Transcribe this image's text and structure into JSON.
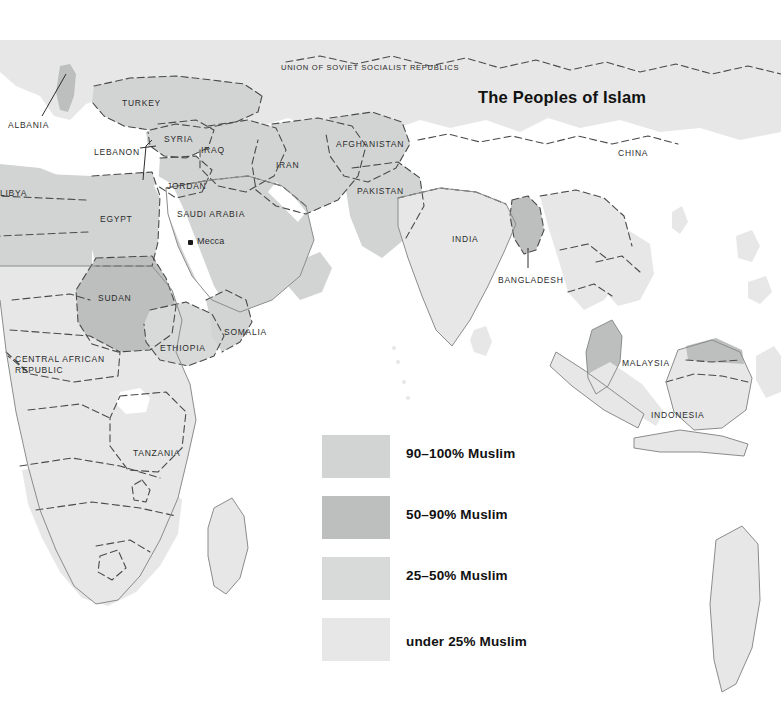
{
  "map": {
    "title": "The Peoples of Islam",
    "colors": {
      "ocean": "#ffffff",
      "tier_90_100": "#d2d4d3",
      "tier_50_90": "#bdbfbe",
      "tier_25_50": "#d8dad9",
      "tier_under_25": "#e6e7e6",
      "border": "#3a3a3a",
      "coastline": "#8a8d8a",
      "label_text": "#2b2b2b",
      "title_text": "#121212"
    },
    "labels": [
      {
        "name": "albania",
        "text": "ALBANIA",
        "x": 8,
        "y": 120
      },
      {
        "name": "turkey",
        "text": "TURKEY",
        "x": 122,
        "y": 98
      },
      {
        "name": "lebanon",
        "text": "LEBANON",
        "x": 94,
        "y": 147
      },
      {
        "name": "syria",
        "text": "SYRIA",
        "x": 164,
        "y": 134
      },
      {
        "name": "iraq",
        "text": "IRAQ",
        "x": 201,
        "y": 145
      },
      {
        "name": "jordan",
        "text": "JORDAN",
        "x": 167,
        "y": 181
      },
      {
        "name": "iran",
        "text": "IRAN",
        "x": 276,
        "y": 160
      },
      {
        "name": "ussr",
        "text": "UNION OF SOVIET SOCIALIST REPUBLICS",
        "x": 281,
        "y": 63
      },
      {
        "name": "afghanistan",
        "text": "AFGHANISTAN",
        "x": 336,
        "y": 139
      },
      {
        "name": "pakistan",
        "text": "PAKISTAN",
        "x": 357,
        "y": 186
      },
      {
        "name": "china",
        "text": "CHINA",
        "x": 618,
        "y": 148
      },
      {
        "name": "india",
        "text": "INDIA",
        "x": 452,
        "y": 234
      },
      {
        "name": "bangladesh",
        "text": "BANGLADESH",
        "x": 498,
        "y": 275
      },
      {
        "name": "libya",
        "text": "LIBYA",
        "x": 0,
        "y": 188
      },
      {
        "name": "egypt",
        "text": "EGYPT",
        "x": 100,
        "y": 214
      },
      {
        "name": "saudi-arabia",
        "text": "SAUDI ARABIA",
        "x": 177,
        "y": 209
      },
      {
        "name": "sudan",
        "text": "SUDAN",
        "x": 98,
        "y": 293
      },
      {
        "name": "ethiopia",
        "text": "ETHIOPIA",
        "x": 160,
        "y": 343
      },
      {
        "name": "somalia",
        "text": "SOMALIA",
        "x": 224,
        "y": 327
      },
      {
        "name": "central-african-republic-1",
        "text": "CENTRAL AFRICAN",
        "x": 15,
        "y": 354
      },
      {
        "name": "central-african-republic-2",
        "text": "REPUBLIC",
        "x": 15,
        "y": 365
      },
      {
        "name": "tanzania",
        "text": "TANZANIA",
        "x": 133,
        "y": 448
      },
      {
        "name": "malaysia",
        "text": "MALAYSIA",
        "x": 622,
        "y": 358
      },
      {
        "name": "indonesia",
        "text": "INDONESIA",
        "x": 651,
        "y": 410
      }
    ],
    "city": {
      "name": "Mecca",
      "text": "Mecca",
      "dot_x": 188,
      "dot_y": 240,
      "label_x": 197,
      "label_y": 236
    }
  },
  "legend": {
    "items": [
      {
        "name": "legend-90-100",
        "label": "90–100% Muslim",
        "color": "#d2d4d3"
      },
      {
        "name": "legend-50-90",
        "label": "50–90% Muslim",
        "color": "#bdbfbe"
      },
      {
        "name": "legend-25-50",
        "label": "25–50% Muslim",
        "color": "#d8dad9"
      },
      {
        "name": "legend-under-25",
        "label": "under 25% Muslim",
        "color": "#e6e7e6"
      }
    ]
  }
}
